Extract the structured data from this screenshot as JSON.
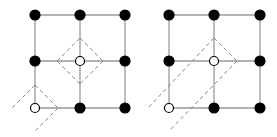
{
  "diagram": {
    "type": "lattice",
    "panels": [
      {
        "name": "left-panel",
        "grid": {
          "cols": [
            35,
            80,
            125
          ],
          "rows": [
            15,
            61,
            108
          ]
        },
        "nodes": [
          {
            "x": 35,
            "y": 15,
            "fill": "black"
          },
          {
            "x": 80,
            "y": 15,
            "fill": "black"
          },
          {
            "x": 125,
            "y": 15,
            "fill": "black"
          },
          {
            "x": 35,
            "y": 61,
            "fill": "black"
          },
          {
            "x": 80,
            "y": 61,
            "fill": "white"
          },
          {
            "x": 125,
            "y": 61,
            "fill": "black"
          },
          {
            "x": 35,
            "y": 108,
            "fill": "white"
          },
          {
            "x": 80,
            "y": 108,
            "fill": "black"
          },
          {
            "x": 125,
            "y": 108,
            "fill": "black"
          }
        ],
        "dashed": [
          [
            80,
            38,
            103,
            61
          ],
          [
            103,
            61,
            80,
            84
          ],
          [
            80,
            84,
            57,
            61
          ],
          [
            57,
            61,
            80,
            38
          ],
          [
            35,
            85,
            12,
            108
          ],
          [
            35,
            85,
            58,
            108
          ],
          [
            58,
            108,
            35,
            131
          ]
        ]
      },
      {
        "name": "right-panel",
        "grid": {
          "cols": [
            169,
            214,
            260
          ],
          "rows": [
            15,
            61,
            108
          ]
        },
        "nodes": [
          {
            "x": 169,
            "y": 15,
            "fill": "black"
          },
          {
            "x": 214,
            "y": 15,
            "fill": "black"
          },
          {
            "x": 260,
            "y": 15,
            "fill": "black"
          },
          {
            "x": 169,
            "y": 61,
            "fill": "black"
          },
          {
            "x": 214,
            "y": 61,
            "fill": "white"
          },
          {
            "x": 260,
            "y": 61,
            "fill": "black"
          },
          {
            "x": 169,
            "y": 108,
            "fill": "white"
          },
          {
            "x": 214,
            "y": 108,
            "fill": "black"
          },
          {
            "x": 260,
            "y": 108,
            "fill": "black"
          }
        ],
        "dashed": [
          [
            214,
            38,
            148,
            108
          ],
          [
            214,
            38,
            237,
            61
          ],
          [
            237,
            61,
            170,
            130
          ]
        ]
      }
    ],
    "colors": {
      "line": "#999999",
      "dash": "#888888",
      "node": "#000000"
    }
  }
}
